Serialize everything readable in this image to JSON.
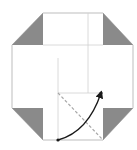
{
  "diagram": {
    "type": "origami-fold-step",
    "colors": {
      "paper": "#ffffff",
      "outline": "#bdbdbd",
      "flap_fill": "#8a8a8a",
      "crease": "#d0d0d0",
      "valley_fold": "#a8a8a8",
      "arrow": "#1a1a1a",
      "point": "#1a1a1a"
    },
    "outline": [
      [
        43,
        13
      ],
      [
        103,
        13
      ],
      [
        133,
        45
      ],
      [
        133,
        108
      ],
      [
        103,
        140
      ],
      [
        43,
        140
      ],
      [
        12,
        108
      ],
      [
        12,
        45
      ]
    ],
    "flaps": [
      {
        "name": "top-left",
        "points": [
          [
            43,
            13
          ],
          [
            43,
            45
          ],
          [
            12,
            45
          ]
        ]
      },
      {
        "name": "top-right",
        "points": [
          [
            103,
            13
          ],
          [
            103,
            45
          ],
          [
            133,
            45
          ]
        ]
      },
      {
        "name": "bottom-left",
        "points": [
          [
            12,
            108
          ],
          [
            43,
            108
          ],
          [
            43,
            140
          ]
        ]
      },
      {
        "name": "bottom-right",
        "points": [
          [
            133,
            108
          ],
          [
            103,
            108
          ],
          [
            103,
            140
          ]
        ]
      }
    ],
    "creases": [
      {
        "name": "vertical-inner-left",
        "from": [
          58,
          58
        ],
        "to": [
          58,
          140
        ]
      },
      {
        "name": "vertical-inner-right",
        "from": [
          88,
          13
        ],
        "to": [
          88,
          93
        ]
      },
      {
        "name": "horizontal-mid",
        "from": [
          58,
          93
        ],
        "to": [
          103,
          93
        ]
      },
      {
        "name": "top-inner",
        "from": [
          43,
          45
        ],
        "to": [
          103,
          45
        ]
      }
    ],
    "valley_fold": {
      "from": [
        58,
        93
      ],
      "to": [
        103,
        140
      ]
    },
    "arrow": {
      "from": [
        58,
        140
      ],
      "to": [
        101,
        93
      ],
      "control": [
        88,
        132
      ]
    },
    "points": [
      {
        "name": "start-point",
        "x": 58,
        "y": 140
      },
      {
        "name": "target-point",
        "x": 101,
        "y": 93
      }
    ]
  }
}
